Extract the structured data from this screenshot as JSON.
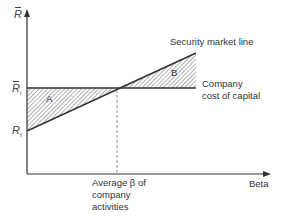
{
  "diagram": {
    "y_axis_label": "R",
    "x_axis_label": "Beta",
    "y_ticks": [
      {
        "label": "R",
        "subscript": "i",
        "bar": true,
        "y": 88
      },
      {
        "label": "R",
        "subscript": "f",
        "bar": false,
        "y": 131
      }
    ],
    "lines": {
      "security_market_line": "Security market line",
      "company_cost_line_1": "Company",
      "company_cost_line_2": "cost of capital"
    },
    "regions": {
      "a": "A",
      "b": "B"
    },
    "average_beta": {
      "line1": "Average β of",
      "line2": "company",
      "line3": "activities"
    },
    "colors": {
      "line": "#333333",
      "hatch": "#555555",
      "dashed": "#777777"
    }
  }
}
